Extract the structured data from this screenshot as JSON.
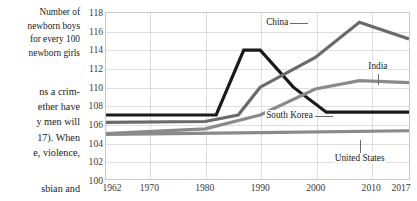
{
  "caption": {
    "lines": [
      "Number of",
      "newborn boys",
      "for every 100",
      "newborn girls"
    ]
  },
  "body_text": {
    "lines": [
      "ns a crim-",
      "ether have",
      "y men will",
      "17). When",
      "e, violence,"
    ],
    "trailing_line": "sbian  and"
  },
  "chart_data": {
    "type": "line",
    "title": "Number of newborn boys for every 100 newborn girls",
    "xlabel": "",
    "ylabel": "",
    "xlim": [
      1962,
      2017
    ],
    "ylim": [
      100,
      118
    ],
    "grid": true,
    "legend": "inline-annotations",
    "x_ticks": [
      "1962",
      "1970",
      "1980",
      "1990",
      "2000",
      "2010",
      "2017"
    ],
    "x_tick_values": [
      1962,
      1970,
      1980,
      1990,
      2000,
      2010,
      2017
    ],
    "y_ticks": [
      "100",
      "102",
      "104",
      "106",
      "108",
      "110",
      "112",
      "114",
      "116",
      "118"
    ],
    "y_tick_values": [
      100,
      102,
      104,
      106,
      108,
      110,
      112,
      114,
      116,
      118
    ],
    "series": [
      {
        "name": "South Korea",
        "color": "#1a1a1a",
        "label": "South Korea",
        "x": [
          1962,
          1982,
          1987,
          1990,
          1996,
          2002,
          2017
        ],
        "values": [
          107.0,
          107.0,
          114.0,
          114.0,
          110.0,
          107.3,
          107.3
        ]
      },
      {
        "name": "China",
        "color": "#6a6a6a",
        "label": "China",
        "x": [
          1962,
          1980,
          1986,
          1990,
          2000,
          2008,
          2017
        ],
        "values": [
          106.2,
          106.3,
          107.0,
          110.0,
          113.2,
          117.0,
          115.2
        ]
      },
      {
        "name": "India",
        "color": "#8a8a8a",
        "label": "India",
        "x": [
          1962,
          1980,
          1990,
          2000,
          2008,
          2017
        ],
        "values": [
          105.0,
          105.5,
          107.0,
          109.8,
          110.7,
          110.5
        ]
      },
      {
        "name": "United States",
        "color": "#8a8a8a",
        "label": "United States",
        "x": [
          1962,
          1990,
          2017
        ],
        "values": [
          104.9,
          105.1,
          105.3
        ]
      }
    ],
    "annotations": [
      {
        "label": "China",
        "x_pct": 52.5,
        "y_pct": 3.0,
        "leader": "right"
      },
      {
        "label": "India",
        "x_pct": 86.0,
        "y_pct": 29.0,
        "leader": "down"
      },
      {
        "label": "South Korea",
        "x_pct": 52.5,
        "y_pct": 58.5,
        "leader": "right"
      },
      {
        "label": "United States",
        "x_pct": 75.0,
        "y_pct": 84.0,
        "leader": "up"
      }
    ]
  }
}
